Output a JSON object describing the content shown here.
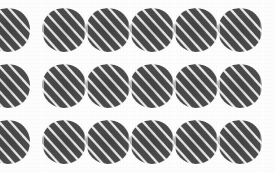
{
  "figure": {
    "width": 275,
    "height": 172,
    "background_color": "#fdfdfd"
  },
  "grid": {
    "rows": 3,
    "columns": 6,
    "tile_width": 44,
    "tile_height": 44,
    "column_pitch": 44,
    "row_pitch": 56,
    "row_top_positions": [
      8,
      64,
      120
    ],
    "column_left_positions": [
      -14,
      42,
      86,
      130,
      174,
      218
    ],
    "first_column_clipped": true
  },
  "tile": {
    "shape_name": "lens",
    "shape_description": "pointed-oval barrel with left and right tips and rounded top and bottom",
    "fill_color": "#4d4d4d",
    "stripe_color": "#f4f4f4",
    "stripe_midtone_color": "#7d7d7d",
    "stripe_angle_degrees": 48,
    "stripe_direction": "lower-left to upper-right",
    "stripe_period_px": 8.4,
    "stripe_count": 11
  },
  "tiles": [
    [
      {
        "row": 1,
        "col": 1,
        "clipped": true
      },
      {
        "row": 1,
        "col": 2,
        "clipped": false
      },
      {
        "row": 1,
        "col": 3,
        "clipped": false
      },
      {
        "row": 1,
        "col": 4,
        "clipped": false
      },
      {
        "row": 1,
        "col": 5,
        "clipped": false
      },
      {
        "row": 1,
        "col": 6,
        "clipped": false
      }
    ],
    [
      {
        "row": 2,
        "col": 1,
        "clipped": true
      },
      {
        "row": 2,
        "col": 2,
        "clipped": false
      },
      {
        "row": 2,
        "col": 3,
        "clipped": false
      },
      {
        "row": 2,
        "col": 4,
        "clipped": false
      },
      {
        "row": 2,
        "col": 5,
        "clipped": false
      },
      {
        "row": 2,
        "col": 6,
        "clipped": false
      }
    ],
    [
      {
        "row": 3,
        "col": 1,
        "clipped": true
      },
      {
        "row": 3,
        "col": 2,
        "clipped": false
      },
      {
        "row": 3,
        "col": 3,
        "clipped": false
      },
      {
        "row": 3,
        "col": 4,
        "clipped": false
      },
      {
        "row": 3,
        "col": 5,
        "clipped": false
      },
      {
        "row": 3,
        "col": 6,
        "clipped": false
      }
    ]
  ]
}
